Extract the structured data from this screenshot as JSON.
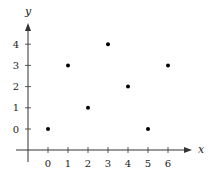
{
  "chart_data": {
    "type": "scatter",
    "title": "",
    "xlabel": "x",
    "ylabel": "y",
    "x": [
      0,
      1,
      2,
      3,
      4,
      5,
      6
    ],
    "y": [
      0,
      3,
      1,
      4,
      2,
      0,
      3
    ],
    "points": [
      {
        "x": 0,
        "y": 0
      },
      {
        "x": 1,
        "y": 3
      },
      {
        "x": 2,
        "y": 1
      },
      {
        "x": 3,
        "y": 4
      },
      {
        "x": 4,
        "y": 2
      },
      {
        "x": 5,
        "y": 0
      },
      {
        "x": 6,
        "y": 3
      }
    ],
    "xticks": [
      "0",
      "1",
      "2",
      "3",
      "4",
      "5",
      "6"
    ],
    "yticks": [
      "0",
      "1",
      "2",
      "3",
      "4"
    ],
    "xlim": [
      -1,
      7
    ],
    "ylim": [
      -1,
      5
    ],
    "grid": false,
    "legend": null,
    "colors": {
      "axis": "#333333",
      "point": "#000000"
    }
  }
}
